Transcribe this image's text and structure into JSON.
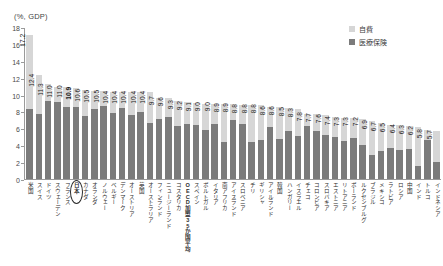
{
  "chart_data": {
    "type": "bar",
    "subtype": "stacked-bar",
    "title": "",
    "axis_unit_label": "(%, GDP)",
    "ylabel": "",
    "xlabel": "",
    "ylim": [
      0,
      18
    ],
    "yticks": [
      0,
      2,
      4,
      6,
      8,
      10,
      12,
      14,
      16,
      18
    ],
    "grid": false,
    "legend_position": "top-right",
    "legend": [
      {
        "name": "自費",
        "color": "#d6d6d6"
      },
      {
        "name": "医療保険",
        "color": "#7b7b7b"
      }
    ],
    "categories": [
      "米国",
      "スイス",
      "ドイツ",
      "スウェーデン",
      "フランス",
      "日本",
      "カナダ",
      "オランダ",
      "ノルウェー",
      "ベルギー",
      "デンマーク",
      "オーストリア",
      "英国",
      "オーストラリア",
      "フィンランド",
      "ニュージーランド",
      "コスタリカ",
      "OECD加盟35か国平均",
      "スペイン",
      "ポルトガル",
      "イタリア",
      "南アフリカ",
      "アイスランド",
      "スロベニア",
      "チリ",
      "ギリシャ",
      "アイルランド",
      "韓国",
      "ハンガリー",
      "イスラエル",
      "チェコ",
      "コロンビア",
      "スロバキア",
      "エストニア",
      "リトアニア",
      "ポーランド",
      "ルクセンブルグ",
      "ブラジル",
      "メキシコ",
      "ラトビア",
      "ロシア",
      "中国",
      "インド",
      "トルコ",
      "インドネシア"
    ],
    "data_labels": [
      "17.2",
      "12.4",
      "11.3",
      "11.0",
      "11.0",
      "10.9",
      "10.6",
      "10.5",
      "10.5",
      "10.4",
      "10.4",
      "10.4",
      "10.4",
      "10.4",
      "9.7",
      "9.6",
      "9.3",
      "9.2",
      "9.1",
      "9.0",
      "9.0",
      "8.9",
      "8.9",
      "8.8",
      "8.8",
      "8.8",
      "8.6",
      "8.6",
      "8.5",
      "8.3",
      "7.8",
      "7.7",
      "7.6",
      "7.4",
      "7.3",
      "7.3",
      "7.2",
      "6.9",
      "6.7",
      "6.5",
      "6.4",
      "6.3",
      "6.2",
      "5.8",
      "5.7"
    ],
    "values": [
      17.2,
      12.4,
      11.3,
      11.0,
      11.0,
      10.9,
      10.6,
      10.5,
      10.5,
      10.4,
      10.4,
      10.4,
      10.4,
      10.4,
      9.7,
      9.6,
      9.3,
      9.2,
      9.1,
      9.0,
      9.0,
      8.9,
      8.9,
      8.8,
      8.8,
      8.8,
      8.6,
      8.6,
      8.5,
      8.3,
      7.8,
      7.7,
      7.6,
      7.4,
      7.3,
      7.3,
      7.2,
      6.9,
      6.7,
      6.5,
      6.4,
      6.3,
      6.2,
      5.8,
      5.7
    ],
    "series": [
      {
        "name": "医療保険",
        "color": "#7b7b7b",
        "values": [
          8.3,
          7.8,
          9.3,
          9.2,
          8.6,
          8.6,
          7.5,
          8.4,
          8.7,
          7.9,
          8.5,
          7.6,
          8.0,
          6.7,
          7.1,
          7.4,
          6.3,
          6.6,
          6.4,
          5.9,
          6.6,
          4.4,
          7.0,
          6.6,
          4.4,
          4.7,
          6.2,
          4.8,
          5.7,
          5.1,
          6.3,
          5.7,
          5.2,
          5.0,
          4.5,
          4.9,
          4.1,
          2.9,
          3.3,
          3.7,
          3.4,
          3.6,
          1.6,
          4.6,
          2.0
        ]
      },
      {
        "name": "自費",
        "color": "#d6d6d6",
        "values": [
          8.9,
          4.6,
          2.0,
          1.8,
          2.4,
          2.3,
          3.1,
          2.1,
          1.8,
          2.5,
          1.9,
          2.8,
          2.4,
          3.7,
          2.6,
          2.2,
          3.0,
          2.6,
          2.7,
          3.1,
          2.4,
          4.5,
          1.9,
          2.2,
          4.4,
          4.1,
          2.4,
          3.8,
          2.8,
          3.2,
          1.5,
          2.0,
          2.4,
          2.4,
          2.8,
          2.4,
          3.1,
          4.0,
          3.4,
          2.8,
          3.0,
          2.7,
          4.6,
          1.2,
          3.7
        ]
      }
    ],
    "highlighted_category": "日本",
    "highlight_style": "ellipse-circle"
  },
  "bars": [
    {
      "label": "米国",
      "total": "17.2",
      "public": 8.3,
      "private": 8.9,
      "circled": false
    },
    {
      "label": "スイス",
      "total": "12.4",
      "public": 7.8,
      "private": 4.6,
      "circled": false
    },
    {
      "label": "ドイツ",
      "total": "11.3",
      "public": 9.3,
      "private": 2.0,
      "circled": false
    },
    {
      "label": "スウェーデン",
      "total": "11.0",
      "public": 9.2,
      "private": 1.8,
      "circled": false
    },
    {
      "label": "フランス",
      "total": "11.0",
      "public": 8.6,
      "private": 2.4,
      "circled": false
    },
    {
      "label": "日本",
      "total": "10.9",
      "public": 8.6,
      "private": 2.3,
      "circled": true
    },
    {
      "label": "カナダ",
      "total": "10.6",
      "public": 7.5,
      "private": 3.1,
      "circled": false
    },
    {
      "label": "オランダ",
      "total": "10.5",
      "public": 8.4,
      "private": 2.1,
      "circled": false
    },
    {
      "label": "ノルウェー",
      "total": "10.5",
      "public": 8.7,
      "private": 1.8,
      "circled": false
    },
    {
      "label": "ベルギー",
      "total": "10.4",
      "public": 7.9,
      "private": 2.5,
      "circled": false
    },
    {
      "label": "デンマーク",
      "total": "10.4",
      "public": 8.5,
      "private": 1.9,
      "circled": false
    },
    {
      "label": "オーストリア",
      "total": "10.4",
      "public": 7.6,
      "private": 2.8,
      "circled": false
    },
    {
      "label": "英国",
      "total": "10.4",
      "public": 8.0,
      "private": 2.4,
      "circled": false
    },
    {
      "label": "オーストラリア",
      "total": "10.4",
      "public": 6.7,
      "private": 3.7,
      "circled": false
    },
    {
      "label": "フィンランド",
      "total": "9.7",
      "public": 7.1,
      "private": 2.6,
      "circled": false
    },
    {
      "label": "ニュージーランド",
      "total": "9.6",
      "public": 7.4,
      "private": 2.2,
      "circled": false
    },
    {
      "label": "コスタリカ",
      "total": "9.3",
      "public": 6.3,
      "private": 3.0,
      "circled": false
    },
    {
      "label": "OECD加盟35か国平均",
      "total": "9.2",
      "public": 6.6,
      "private": 2.6,
      "circled": false
    },
    {
      "label": "スペイン",
      "total": "9.1",
      "public": 6.4,
      "private": 2.7,
      "circled": false
    },
    {
      "label": "ポルトガル",
      "total": "9.0",
      "public": 5.9,
      "private": 3.1,
      "circled": false
    },
    {
      "label": "イタリア",
      "total": "9.0",
      "public": 6.6,
      "private": 2.4,
      "circled": false
    },
    {
      "label": "南アフリカ",
      "total": "8.9",
      "public": 4.4,
      "private": 4.5,
      "circled": false
    },
    {
      "label": "アイスランド",
      "total": "8.9",
      "public": 7.0,
      "private": 1.9,
      "circled": false
    },
    {
      "label": "スロベニア",
      "total": "8.8",
      "public": 6.6,
      "private": 2.2,
      "circled": false
    },
    {
      "label": "チリ",
      "total": "8.8",
      "public": 4.4,
      "private": 4.4,
      "circled": false
    },
    {
      "label": "ギリシャ",
      "total": "8.8",
      "public": 4.7,
      "private": 4.1,
      "circled": false
    },
    {
      "label": "アイルランド",
      "total": "8.6",
      "public": 6.2,
      "private": 2.4,
      "circled": false
    },
    {
      "label": "韓国",
      "total": "8.6",
      "public": 4.8,
      "private": 3.8,
      "circled": false
    },
    {
      "label": "ハンガリー",
      "total": "8.5",
      "public": 5.7,
      "private": 2.8,
      "circled": false
    },
    {
      "label": "イスラエル",
      "total": "8.3",
      "public": 5.1,
      "private": 3.2,
      "circled": false
    },
    {
      "label": "チェコ",
      "total": "7.8",
      "public": 6.3,
      "private": 1.5,
      "circled": false
    },
    {
      "label": "コロンビア",
      "total": "7.7",
      "public": 5.7,
      "private": 2.0,
      "circled": false
    },
    {
      "label": "スロバキア",
      "total": "7.6",
      "public": 5.2,
      "private": 2.4,
      "circled": false
    },
    {
      "label": "エストニア",
      "total": "7.4",
      "public": 5.0,
      "private": 2.4,
      "circled": false
    },
    {
      "label": "リトアニア",
      "total": "7.3",
      "public": 4.5,
      "private": 2.8,
      "circled": false
    },
    {
      "label": "ポーランド",
      "total": "7.3",
      "public": 4.9,
      "private": 2.4,
      "circled": false
    },
    {
      "label": "ルクセンブルグ",
      "total": "7.2",
      "public": 4.1,
      "private": 3.1,
      "circled": false
    },
    {
      "label": "ブラジル",
      "total": "6.9",
      "public": 2.9,
      "private": 4.0,
      "circled": false
    },
    {
      "label": "メキシコ",
      "total": "6.7",
      "public": 3.3,
      "private": 3.4,
      "circled": false
    },
    {
      "label": "ラトビア",
      "total": "6.5",
      "public": 3.7,
      "private": 2.8,
      "circled": false
    },
    {
      "label": "ロシア",
      "total": "6.4",
      "public": 3.4,
      "private": 3.0,
      "circled": false
    },
    {
      "label": "中国",
      "total": "6.3",
      "public": 3.6,
      "private": 2.7,
      "circled": false
    },
    {
      "label": "インド",
      "total": "6.2",
      "public": 1.6,
      "private": 4.6,
      "circled": false
    },
    {
      "label": "トルコ",
      "total": "5.8",
      "public": 4.6,
      "private": 1.2,
      "circled": false
    },
    {
      "label": "インドネシア",
      "total": "5.7",
      "public": 2.0,
      "private": 3.7,
      "circled": false
    }
  ]
}
